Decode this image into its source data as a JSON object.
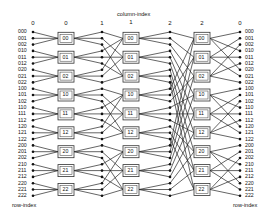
{
  "diagram": {
    "column_axis_label": "column-index",
    "row_axis_label": "row-index",
    "column_headers": [
      "0",
      "0",
      "1",
      "1",
      "2",
      "2",
      "0"
    ],
    "row_labels": [
      "000",
      "001",
      "002",
      "010",
      "011",
      "012",
      "020",
      "021",
      "022",
      "100",
      "101",
      "102",
      "110",
      "111",
      "112",
      "120",
      "121",
      "122",
      "200",
      "201",
      "202",
      "210",
      "211",
      "212",
      "220",
      "221",
      "222"
    ],
    "switch_labels": [
      "00",
      "01",
      "02",
      "10",
      "11",
      "12",
      "20",
      "21",
      "22"
    ],
    "switch_columns": 3,
    "colors": {
      "line": "#222222",
      "dot": "#111111",
      "box_fill": "#ffffff",
      "box_stroke": "#333333"
    }
  }
}
